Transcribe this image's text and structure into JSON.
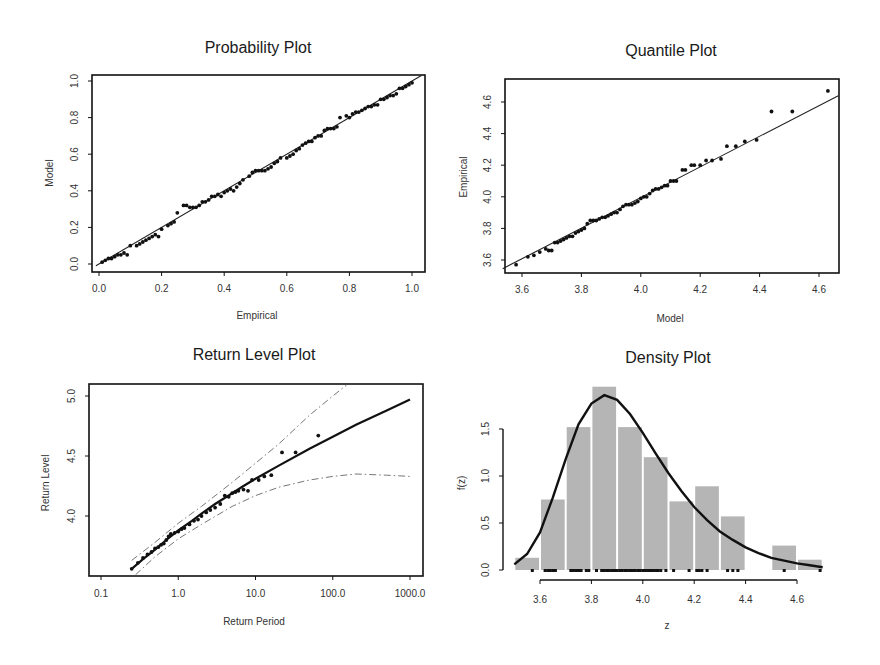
{
  "figure": {
    "panels": [
      {
        "id": "probability",
        "title": "Probability Plot",
        "xlabel": "Empirical",
        "ylabel": "Model"
      },
      {
        "id": "quantile",
        "title": "Quantile Plot",
        "xlabel": "Model",
        "ylabel": "Empirical"
      },
      {
        "id": "return_level",
        "title": "Return Level Plot",
        "xlabel": "Return Period",
        "ylabel": "Return Level"
      },
      {
        "id": "density",
        "title": "Density Plot",
        "xlabel": "z",
        "ylabel": "f(z)"
      }
    ]
  },
  "chart_data": [
    {
      "type": "scatter",
      "title": "Probability Plot",
      "xlabel": "Empirical",
      "ylabel": "Model",
      "xlim": [
        -0.01,
        1.03
      ],
      "ylim": [
        -0.02,
        1.01
      ],
      "xticks": [
        0.0,
        0.2,
        0.4,
        0.6,
        0.8,
        1.0
      ],
      "xtick_labels": [
        "0.0",
        "0.2",
        "0.4",
        "0.6",
        "0.8",
        "1.0"
      ],
      "yticks": [
        0.0,
        0.2,
        0.4,
        0.6,
        0.8,
        1.0
      ],
      "ytick_labels": [
        "0.0",
        "0.2",
        "0.4",
        "0.6",
        "0.8",
        "1.0"
      ],
      "reference_line": {
        "x": [
          -0.01,
          1.03
        ],
        "y": [
          -0.01,
          1.03
        ]
      },
      "points": {
        "x": [
          0.01,
          0.02,
          0.03,
          0.04,
          0.05,
          0.06,
          0.07,
          0.08,
          0.09,
          0.1,
          0.12,
          0.13,
          0.14,
          0.15,
          0.16,
          0.17,
          0.18,
          0.19,
          0.2,
          0.22,
          0.23,
          0.24,
          0.25,
          0.27,
          0.28,
          0.29,
          0.3,
          0.31,
          0.32,
          0.33,
          0.34,
          0.35,
          0.36,
          0.37,
          0.38,
          0.39,
          0.4,
          0.41,
          0.42,
          0.43,
          0.44,
          0.45,
          0.46,
          0.48,
          0.49,
          0.5,
          0.51,
          0.52,
          0.53,
          0.54,
          0.55,
          0.56,
          0.57,
          0.58,
          0.6,
          0.61,
          0.62,
          0.63,
          0.64,
          0.65,
          0.66,
          0.67,
          0.68,
          0.69,
          0.7,
          0.71,
          0.72,
          0.73,
          0.74,
          0.75,
          0.76,
          0.77,
          0.79,
          0.8,
          0.81,
          0.82,
          0.83,
          0.84,
          0.85,
          0.86,
          0.87,
          0.88,
          0.89,
          0.9,
          0.91,
          0.92,
          0.93,
          0.94,
          0.95,
          0.96,
          0.97,
          0.98,
          0.99,
          1.0
        ],
        "y": [
          0.01,
          0.02,
          0.03,
          0.03,
          0.04,
          0.05,
          0.05,
          0.06,
          0.05,
          0.1,
          0.1,
          0.11,
          0.12,
          0.13,
          0.14,
          0.15,
          0.16,
          0.15,
          0.19,
          0.21,
          0.22,
          0.23,
          0.28,
          0.32,
          0.32,
          0.31,
          0.31,
          0.31,
          0.32,
          0.34,
          0.34,
          0.35,
          0.37,
          0.37,
          0.38,
          0.37,
          0.39,
          0.4,
          0.41,
          0.4,
          0.42,
          0.44,
          0.46,
          0.48,
          0.5,
          0.51,
          0.51,
          0.51,
          0.51,
          0.52,
          0.53,
          0.55,
          0.56,
          0.58,
          0.58,
          0.59,
          0.6,
          0.62,
          0.63,
          0.65,
          0.66,
          0.67,
          0.67,
          0.69,
          0.7,
          0.7,
          0.73,
          0.74,
          0.74,
          0.74,
          0.75,
          0.8,
          0.81,
          0.8,
          0.82,
          0.83,
          0.83,
          0.84,
          0.85,
          0.86,
          0.86,
          0.87,
          0.87,
          0.9,
          0.9,
          0.91,
          0.92,
          0.92,
          0.93,
          0.96,
          0.96,
          0.97,
          0.98,
          0.99
        ]
      },
      "grid": false
    },
    {
      "type": "scatter",
      "title": "Quantile Plot",
      "xlabel": "Model",
      "ylabel": "Empirical",
      "xlim": [
        3.535,
        4.665
      ],
      "ylim": [
        3.53,
        4.73
      ],
      "xticks": [
        3.6,
        3.8,
        4.0,
        4.2,
        4.4,
        4.6
      ],
      "xtick_labels": [
        "3.6",
        "3.8",
        "4.0",
        "4.2",
        "4.4",
        "4.6"
      ],
      "yticks": [
        3.6,
        3.8,
        4.0,
        4.2,
        4.4,
        4.6
      ],
      "ytick_labels": [
        "3.6",
        "3.8",
        "4.0",
        "4.2",
        "4.4",
        "4.6"
      ],
      "reference_line": {
        "x": [
          3.535,
          4.665
        ],
        "y": [
          3.545,
          4.64
        ]
      },
      "points": {
        "x": [
          3.58,
          3.62,
          3.64,
          3.66,
          3.68,
          3.69,
          3.7,
          3.71,
          3.72,
          3.73,
          3.74,
          3.75,
          3.76,
          3.77,
          3.78,
          3.79,
          3.8,
          3.81,
          3.82,
          3.83,
          3.84,
          3.85,
          3.86,
          3.87,
          3.88,
          3.89,
          3.9,
          3.91,
          3.92,
          3.93,
          3.94,
          3.95,
          3.96,
          3.97,
          3.98,
          3.99,
          4.0,
          4.01,
          4.02,
          4.03,
          4.04,
          4.05,
          4.06,
          4.07,
          4.08,
          4.09,
          4.1,
          4.11,
          4.12,
          4.14,
          4.15,
          4.17,
          4.18,
          4.2,
          4.22,
          4.24,
          4.27,
          4.29,
          4.32,
          4.35,
          4.39,
          4.44,
          4.51,
          4.63
        ],
        "y": [
          3.57,
          3.62,
          3.63,
          3.65,
          3.67,
          3.66,
          3.66,
          3.71,
          3.71,
          3.72,
          3.73,
          3.74,
          3.75,
          3.75,
          3.77,
          3.78,
          3.79,
          3.8,
          3.83,
          3.85,
          3.85,
          3.85,
          3.86,
          3.87,
          3.87,
          3.88,
          3.89,
          3.9,
          3.9,
          3.92,
          3.94,
          3.95,
          3.95,
          3.95,
          3.96,
          3.97,
          3.99,
          4.0,
          4.0,
          4.02,
          4.04,
          4.05,
          4.05,
          4.06,
          4.07,
          4.07,
          4.1,
          4.1,
          4.1,
          4.17,
          4.17,
          4.2,
          4.2,
          4.2,
          4.23,
          4.23,
          4.24,
          4.32,
          4.32,
          4.35,
          4.36,
          4.54,
          4.54,
          4.67
        ]
      },
      "grid": false
    },
    {
      "type": "line",
      "title": "Return Level Plot",
      "xlabel": "Return Period",
      "ylabel": "Return Level",
      "xscale": "log",
      "xlim": [
        0.07,
        1800
      ],
      "ylim": [
        3.51,
        5.09
      ],
      "xticks": [
        0.1,
        1.0,
        10.0,
        100.0,
        1000.0
      ],
      "xtick_labels": [
        "0.1",
        "1.0",
        "10.0",
        "100.0",
        "1000.0"
      ],
      "yticks": [
        4.0,
        4.5,
        5.0
      ],
      "ytick_labels": [
        "4.0",
        "4.5",
        "5.0"
      ],
      "series": [
        {
          "name": "Return level estimate",
          "style": "solid",
          "x": [
            0.25,
            0.35,
            0.5,
            0.7,
            1.0,
            1.5,
            2.0,
            3.0,
            5.0,
            7.0,
            10.0,
            20.0,
            50.0,
            100.0,
            200.0,
            500.0,
            1000.0
          ],
          "y": [
            3.56,
            3.64,
            3.72,
            3.8,
            3.88,
            3.96,
            4.02,
            4.1,
            4.19,
            4.25,
            4.31,
            4.42,
            4.56,
            4.66,
            4.76,
            4.88,
            4.97
          ]
        },
        {
          "name": "Upper 95% CI",
          "style": "dashdot",
          "x": [
            0.25,
            0.5,
            1.0,
            2.0,
            5.0,
            10.0,
            20.0,
            50.0,
            100.0,
            150.0
          ],
          "y": [
            3.63,
            3.78,
            3.94,
            4.08,
            4.28,
            4.44,
            4.6,
            4.84,
            5.0,
            5.09
          ]
        },
        {
          "name": "Lower 95% CI",
          "style": "dashdot",
          "x": [
            0.28,
            0.5,
            1.0,
            2.0,
            5.0,
            10.0,
            20.0,
            50.0,
            100.0,
            200.0,
            500.0,
            1000.0
          ],
          "y": [
            3.51,
            3.66,
            3.81,
            3.93,
            4.08,
            4.17,
            4.24,
            4.3,
            4.33,
            4.35,
            4.34,
            4.33
          ]
        }
      ],
      "points": {
        "x": [
          0.25,
          0.3,
          0.35,
          0.4,
          0.45,
          0.5,
          0.55,
          0.6,
          0.65,
          0.7,
          0.75,
          0.8,
          0.9,
          1.0,
          1.1,
          1.2,
          1.4,
          1.6,
          1.8,
          2.0,
          2.3,
          2.6,
          3.0,
          3.5,
          4.0,
          4.5,
          5.0,
          5.5,
          6.0,
          7.0,
          8.0,
          9.0,
          11.0,
          13.0,
          16.0,
          22.0,
          33.0,
          65.0
        ],
        "y": [
          3.56,
          3.61,
          3.65,
          3.68,
          3.7,
          3.73,
          3.74,
          3.76,
          3.77,
          3.8,
          3.83,
          3.85,
          3.86,
          3.87,
          3.89,
          3.9,
          3.93,
          3.96,
          3.97,
          4.0,
          4.03,
          4.05,
          4.07,
          4.1,
          4.17,
          4.16,
          4.19,
          4.2,
          4.21,
          4.22,
          4.21,
          4.3,
          4.3,
          4.33,
          4.34,
          4.53,
          4.53,
          4.67
        ]
      },
      "grid": false
    },
    {
      "type": "bar",
      "title": "Density Plot",
      "xlabel": "z",
      "ylabel": "f(z)",
      "xlim": [
        3.5,
        4.7
      ],
      "ylim": [
        0.0,
        2.0
      ],
      "xticks": [
        3.6,
        3.8,
        4.0,
        4.2,
        4.4,
        4.6
      ],
      "xtick_labels": [
        "3.6",
        "3.8",
        "4.0",
        "4.2",
        "4.4",
        "4.6"
      ],
      "yticks": [
        0.0,
        0.5,
        1.0,
        1.5
      ],
      "ytick_labels": [
        "0.0",
        "0.5",
        "1.0",
        "1.5"
      ],
      "bins": [
        [
          3.5,
          3.6
        ],
        [
          3.6,
          3.7
        ],
        [
          3.7,
          3.8
        ],
        [
          3.8,
          3.9
        ],
        [
          3.9,
          4.0
        ],
        [
          4.0,
          4.1
        ],
        [
          4.1,
          4.2
        ],
        [
          4.2,
          4.3
        ],
        [
          4.3,
          4.4
        ],
        [
          4.4,
          4.5
        ],
        [
          4.5,
          4.6
        ],
        [
          4.6,
          4.7
        ]
      ],
      "categories": [
        "3.5-3.6",
        "3.6-3.7",
        "3.7-3.8",
        "3.8-3.9",
        "3.9-4.0",
        "4.0-4.1",
        "4.1-4.2",
        "4.2-4.3",
        "4.3-4.4",
        "4.4-4.5",
        "4.5-4.6",
        "4.6-4.7"
      ],
      "values": [
        0.13,
        0.75,
        1.52,
        1.95,
        1.52,
        1.2,
        0.73,
        0.89,
        0.57,
        0.0,
        0.26,
        0.11
      ],
      "density_curve": {
        "x": [
          3.5,
          3.55,
          3.6,
          3.65,
          3.7,
          3.75,
          3.8,
          3.85,
          3.9,
          3.95,
          4.0,
          4.05,
          4.1,
          4.15,
          4.2,
          4.25,
          4.3,
          4.35,
          4.4,
          4.45,
          4.5,
          4.55,
          4.6,
          4.65,
          4.7
        ],
        "y": [
          0.06,
          0.17,
          0.4,
          0.77,
          1.18,
          1.55,
          1.77,
          1.86,
          1.81,
          1.66,
          1.46,
          1.24,
          1.03,
          0.84,
          0.67,
          0.53,
          0.41,
          0.32,
          0.24,
          0.18,
          0.13,
          0.1,
          0.07,
          0.05,
          0.03
        ]
      },
      "rug": [
        3.57,
        3.62,
        3.63,
        3.64,
        3.65,
        3.66,
        3.72,
        3.73,
        3.74,
        3.75,
        3.76,
        3.78,
        3.79,
        3.82,
        3.84,
        3.85,
        3.86,
        3.87,
        3.88,
        3.89,
        3.9,
        3.91,
        3.92,
        3.93,
        3.94,
        3.95,
        3.96,
        3.97,
        3.98,
        3.99,
        4.0,
        4.01,
        4.02,
        4.03,
        4.04,
        4.05,
        4.06,
        4.07,
        4.09,
        4.12,
        4.18,
        4.21,
        4.22,
        4.23,
        4.25,
        4.33,
        4.35,
        4.37,
        4.55,
        4.69
      ],
      "grid": false
    }
  ]
}
